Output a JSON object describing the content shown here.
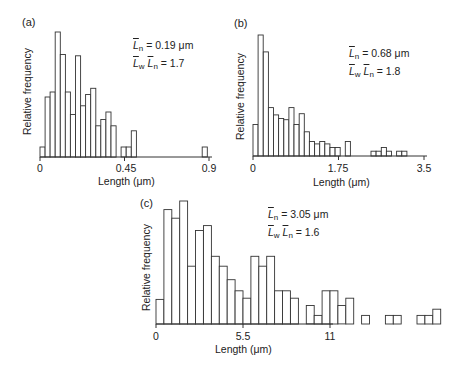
{
  "chart_data": [
    {
      "type": "bar",
      "panel_label": "(a)",
      "title": "",
      "xlabel": "Length (μm)",
      "ylabel": "Relative frequency",
      "xlim": [
        0,
        0.9
      ],
      "xticks": [
        "0",
        "0.45",
        "0.9"
      ],
      "annotations": [
        "L̄n = 0.19 μm",
        "L̄w / L̄n = 1.7"
      ],
      "bin_width": 0.027,
      "bin_starts": [
        0.0,
        0.027,
        0.054,
        0.081,
        0.108,
        0.135,
        0.162,
        0.189,
        0.216,
        0.243,
        0.27,
        0.297,
        0.324,
        0.351,
        0.378,
        0.405,
        0.432,
        0.459,
        0.486,
        0.756,
        0.864
      ],
      "values": [
        0.08,
        0.48,
        0.52,
        1.0,
        0.82,
        0.52,
        0.34,
        0.81,
        0.41,
        0.5,
        0.55,
        0.25,
        0.3,
        0.36,
        0.25,
        0.0,
        0.08,
        0.08,
        0.21,
        0.0,
        0.08
      ],
      "grid": false
    },
    {
      "type": "bar",
      "panel_label": "(b)",
      "title": "",
      "xlabel": "Length (μm)",
      "ylabel": "Relative frequency",
      "xlim": [
        0,
        3.5
      ],
      "xticks": [
        "0",
        "1.75",
        "3.5"
      ],
      "annotations": [
        "L̄n = 0.68 μm",
        "L̄w / L̄n = 1.8"
      ],
      "bin_width": 0.105,
      "values": [
        0.26,
        1.0,
        0.86,
        0.4,
        0.34,
        0.31,
        0.3,
        0.4,
        0.26,
        0.35,
        0.2,
        0.12,
        0.1,
        0.12,
        0.1,
        0.07,
        0.07,
        0.0,
        0.12,
        0.0,
        0.0,
        0.0,
        0.0,
        0.04,
        0.04,
        0.07,
        0.04,
        0.0,
        0.04,
        0.04,
        0.0,
        0.0,
        0.0,
        0.0,
        0.0,
        0.0,
        0.0,
        0.0,
        0.0,
        0.0,
        0.0,
        0.0,
        0.0,
        0.04
      ],
      "grid": false
    },
    {
      "type": "bar",
      "panel_label": "(c)",
      "title": "",
      "xlabel": "Length (μm)",
      "ylabel": "Relative frequency",
      "xlim": [
        0,
        11
      ],
      "xticks": [
        "0",
        "5.5",
        "11"
      ],
      "annotations": [
        "L̄n = 3.05 μm",
        "L̄w / L̄n = 1.6"
      ],
      "bin_width": 0.5,
      "values": [
        0.2,
        0.93,
        0.86,
        1.0,
        0.47,
        0.76,
        0.8,
        0.55,
        0.47,
        0.36,
        0.27,
        0.21,
        0.55,
        0.47,
        0.55,
        0.27,
        0.27,
        0.21,
        0.0,
        0.15,
        0.07,
        0.27,
        0.27,
        0.15,
        0.21,
        0.0,
        0.07,
        0.0,
        0.0,
        0.07,
        0.07,
        0.0,
        0.0,
        0.07,
        0.07,
        0.12
      ],
      "grid": false
    }
  ],
  "panels": [
    {
      "label": "(a)",
      "ylabel": "Relative frequency",
      "xlabel": "Length (μm)",
      "ticks": [
        "0",
        "0.45",
        "0.9"
      ],
      "anno_ln_value": "= 0.19 μm",
      "anno_ratio_value": "= 1.7"
    },
    {
      "label": "(b)",
      "ylabel": "Relative frequency",
      "xlabel": "Length (μm)",
      "ticks": [
        "0",
        "1.75",
        "3.5"
      ],
      "anno_ln_value": "= 0.68 μm",
      "anno_ratio_value": "= 1.8"
    },
    {
      "label": "(c)",
      "ylabel": "Relative frequency",
      "xlabel": "Length (μm)",
      "ticks": [
        "0",
        "5.5",
        "11"
      ],
      "anno_ln_value": "= 3.05 μm",
      "anno_ratio_value": "= 1.6"
    }
  ],
  "symbols": {
    "L": "L",
    "n": "n",
    "w": "w"
  }
}
